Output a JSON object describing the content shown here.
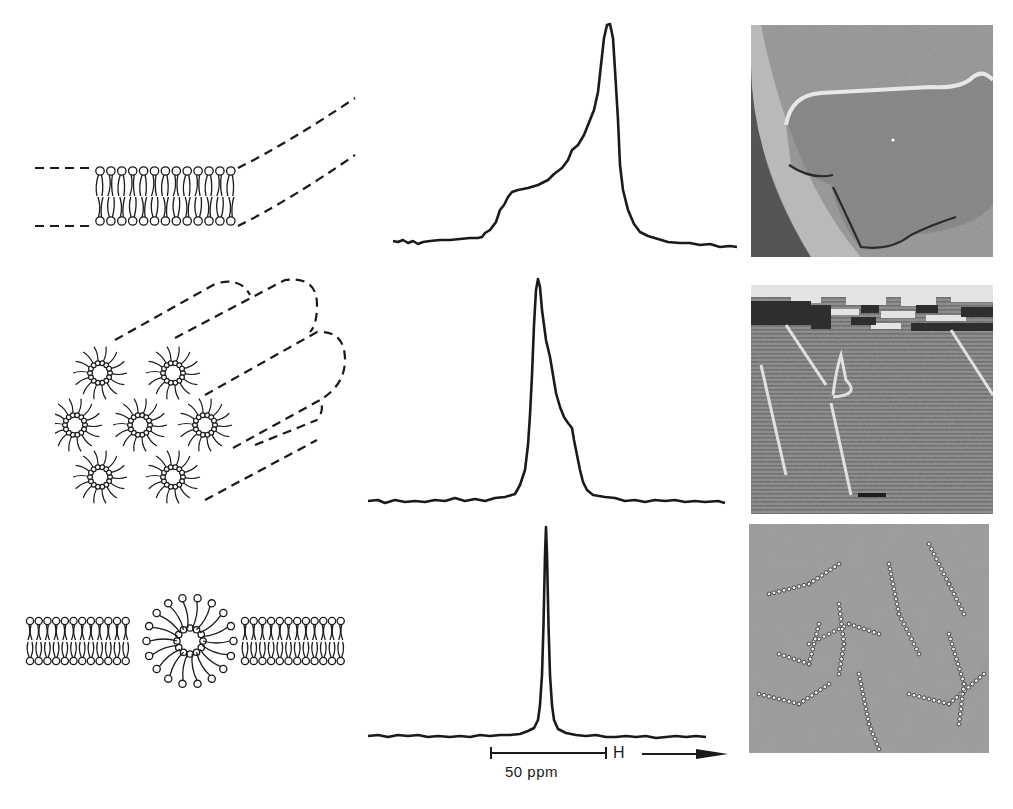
{
  "figure": {
    "rows": [
      {
        "phase": "lamellar-bilayer",
        "diagram": "bilayer-diagram",
        "spectrum": "axially-symmetric-powder-pattern",
        "micrograph": "freeze-fracture-smooth-bilayer"
      },
      {
        "phase": "hexagonal-HII",
        "diagram": "inverted-cylinders-diagram",
        "spectrum": "reduced-width-reversed-lineshape",
        "micrograph": "freeze-fracture-striated-tubes"
      },
      {
        "phase": "isotropic-lipidic-particles",
        "diagram": "inverted-micelle-in-bilayer-diagram",
        "spectrum": "narrow-isotropic-peak",
        "micrograph": "freeze-fracture-particles"
      }
    ],
    "scale_bar": {
      "label": "50 ppm"
    },
    "field_arrow": {
      "label": "H"
    },
    "colors": {
      "ink": "#1a1a1a",
      "background": "#ffffff"
    }
  },
  "chart_data": [
    {
      "type": "line",
      "title": "31P-NMR spectrum — bilayer phase",
      "xlabel": "chemical shift (field H increasing →)",
      "ylabel": "",
      "x_relative_ppm": [
        -45,
        -35,
        -25,
        -20,
        -15,
        -10,
        -5,
        0,
        3,
        6,
        10,
        20,
        30
      ],
      "values": [
        0.0,
        0.02,
        0.29,
        0.33,
        0.4,
        0.52,
        0.68,
        1.0,
        0.55,
        0.15,
        0.05,
        0.01,
        0.0
      ],
      "annotations": [
        "shoulder at high-field side",
        "sharp low-field peak"
      ]
    },
    {
      "type": "line",
      "title": "31P-NMR spectrum — hexagonal HII phase",
      "xlabel": "chemical shift (field H increasing →)",
      "ylabel": "",
      "x_relative_ppm": [
        -35,
        -10,
        -3,
        0,
        4,
        8,
        12,
        15,
        18,
        25,
        45
      ],
      "values": [
        0.0,
        0.02,
        0.4,
        1.0,
        0.82,
        0.55,
        0.3,
        0.25,
        0.05,
        0.0,
        0.0
      ],
      "annotations": [
        "peak at high-field side",
        "shoulder at low-field side"
      ]
    },
    {
      "type": "line",
      "title": "31P-NMR spectrum — isotropic phase",
      "xlabel": "chemical shift (field H increasing →)",
      "ylabel": "",
      "x_relative_ppm": [
        -40,
        -5,
        -2,
        0,
        2,
        5,
        40
      ],
      "values": [
        0.0,
        0.03,
        0.3,
        1.0,
        0.3,
        0.03,
        0.0
      ],
      "annotations": [
        "single narrow symmetric line"
      ]
    }
  ]
}
